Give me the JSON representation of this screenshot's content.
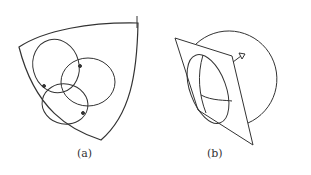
{
  "figure": {
    "subfigures": [
      {
        "id": "a",
        "caption": "(a)",
        "description": "Curved triangular surface patch containing three overlapping circles with marked intersection points"
      },
      {
        "id": "b",
        "caption": "(b)",
        "description": "Large circle (sphere) with a tilted plane cutting it; elliptical cross-section with arcs; small arrow tip at plane corner"
      }
    ],
    "colors": {
      "stroke": "#333333",
      "background": "#ffffff"
    }
  }
}
